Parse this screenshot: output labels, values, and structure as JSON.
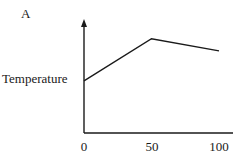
{
  "panel_label": "A",
  "chart_data": {
    "type": "line",
    "title": "",
    "xlabel": "",
    "ylabel": "Temperature",
    "x_ticks": [
      "0",
      "50",
      "100"
    ],
    "series": [
      {
        "name": "Temperature",
        "x": [
          0,
          50,
          100
        ],
        "y": [
          0.47,
          0.85,
          0.74
        ]
      }
    ],
    "xlim": [
      0,
      110
    ],
    "ylim": [
      0,
      1
    ],
    "grid": false,
    "legend": null
  }
}
